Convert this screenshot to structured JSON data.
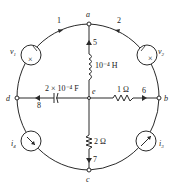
{
  "diagram": {
    "type": "circuit",
    "nodes": [
      {
        "id": "a",
        "label": "a"
      },
      {
        "id": "b",
        "label": "b"
      },
      {
        "id": "c",
        "label": "c"
      },
      {
        "id": "d",
        "label": "d"
      },
      {
        "id": "e",
        "label": "e"
      }
    ],
    "branches": [
      {
        "number": "1",
        "from": "d",
        "to": "a",
        "element": "voltage source",
        "label": "v1"
      },
      {
        "number": "2",
        "from": "b",
        "to": "a",
        "element": "voltage source",
        "label": "v2"
      },
      {
        "number": "3",
        "from": "c",
        "to": "b",
        "element": "current source",
        "label": "i3"
      },
      {
        "number": "4",
        "from": "d",
        "to": "c",
        "element": "current source",
        "label": "i4"
      },
      {
        "number": "5",
        "from": "e",
        "to": "a",
        "element": "inductor",
        "value": "10⁻⁴ H"
      },
      {
        "number": "6",
        "from": "e",
        "to": "b",
        "element": "resistor",
        "value": "1 Ω"
      },
      {
        "number": "7",
        "from": "e",
        "to": "c",
        "element": "resistor",
        "value": "2 Ω"
      },
      {
        "number": "8",
        "from": "e",
        "to": "d",
        "element": "capacitor",
        "value": "2 × 10⁻⁴ F"
      }
    ]
  },
  "labels": {
    "node_a": "a",
    "node_b": "b",
    "node_c": "c",
    "node_d": "d",
    "node_e": "e",
    "branch1": "1",
    "branch2": "2",
    "branch5": "5",
    "branch6": "6",
    "branch7": "7",
    "branch8": "8",
    "v1": "v",
    "v1_sub": "1",
    "v2": "v",
    "v2_sub": "2",
    "i3": "i",
    "i3_sub": "3",
    "i4": "i",
    "i4_sub": "4",
    "inductor_value": "10⁻⁴ H",
    "capacitor_value": "2 × 10⁻⁴ F",
    "resistor6_value": "1 Ω",
    "resistor7_value": "2 Ω"
  }
}
